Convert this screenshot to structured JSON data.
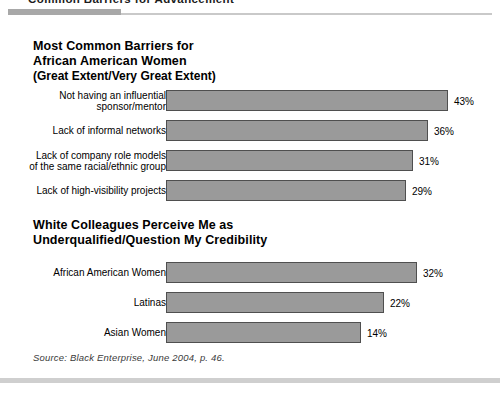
{
  "running_head": {
    "title": "Common Barriers for Advancement"
  },
  "figure": {
    "chart_one": {
      "title_line1": "Most Common Barriers for",
      "title_line2": "African American Women",
      "subtitle": "(Great Extent/Very Great Extent)"
    },
    "chart_two": {
      "title_line1": "White Colleagues Perceive Me as",
      "title_line2": "Underqualified/Question My Credibility"
    },
    "source": "Source: Black Enterprise, June 2004, p. 46."
  },
  "colors": {
    "bar_fill": "#9a9a9a",
    "bar_border": "#4f4f4f",
    "rule_gray": "#a8a8a8",
    "foot_rule": "#cfcfcf",
    "text": "#000000"
  },
  "chart_data": [
    {
      "type": "bar",
      "orientation": "horizontal",
      "title": "Most Common Barriers for African American Women",
      "subtitle": "(Great Extent/Very Great Extent)",
      "xlabel": "",
      "ylabel": "",
      "categories": [
        "Not having an influential\nsponsor/mentor",
        "Lack of informal networks",
        "Lack of company role models\nof the same racial/ethnic group",
        "Lack of high-visibility projects"
      ],
      "values": [
        43,
        36,
        31,
        29
      ],
      "value_labels": [
        "43%",
        "36%",
        "31%",
        "29%"
      ],
      "units": "percent",
      "grid": false,
      "legend": "none",
      "bar_px_widths": [
        282,
        262,
        247,
        240
      ]
    },
    {
      "type": "bar",
      "orientation": "horizontal",
      "title": "White Colleagues Perceive Me as Underqualified/Question My Credibility",
      "subtitle": "",
      "xlabel": "",
      "ylabel": "",
      "categories": [
        "African American Women",
        "Latinas",
        "Asian Women"
      ],
      "values": [
        32,
        22,
        14
      ],
      "value_labels": [
        "32%",
        "22%",
        "14%"
      ],
      "units": "percent",
      "grid": false,
      "legend": "none",
      "bar_px_widths": [
        251,
        218,
        195
      ]
    }
  ]
}
